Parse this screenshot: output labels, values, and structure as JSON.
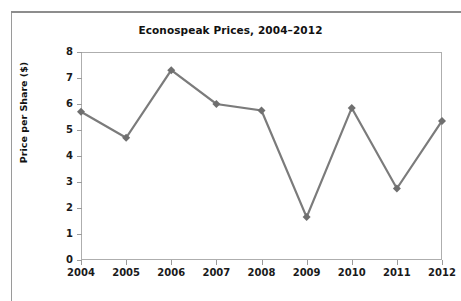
{
  "chart_data": {
    "type": "line",
    "title": "Econospeak Prices, 2004–2012",
    "xlabel": "",
    "ylabel": "Price per Share ($)",
    "categories": [
      "2004",
      "2005",
      "2006",
      "2007",
      "2008",
      "2009",
      "2010",
      "2011",
      "2012"
    ],
    "values": [
      5.7,
      4.7,
      7.3,
      6.0,
      5.75,
      1.65,
      5.85,
      2.75,
      5.35
    ],
    "series": [
      {
        "name": "Price per Share ($)",
        "values": [
          5.7,
          4.7,
          7.3,
          6.0,
          5.75,
          1.65,
          5.85,
          2.75,
          5.35
        ]
      }
    ],
    "ylim": [
      0,
      8
    ],
    "y_ticks": [
      "8",
      "7",
      "6",
      "5",
      "4",
      "3",
      "2",
      "1",
      "0"
    ],
    "y_tick_values": [
      8,
      7,
      6,
      5,
      4,
      3,
      2,
      1,
      0
    ],
    "x_ticks": [
      "2004",
      "2005",
      "2006",
      "2007",
      "2008",
      "2009",
      "2010",
      "2011",
      "2012"
    ],
    "grid": false,
    "legend": false,
    "legend_position": "none",
    "marker": "diamond",
    "colors": {
      "line": "#7b7b7b",
      "marker": "#6f6f6f",
      "axis": "#aeaeae",
      "text": "#1a1a1a",
      "panel_border": "#9a9a9a",
      "background": "#ffffff"
    }
  }
}
